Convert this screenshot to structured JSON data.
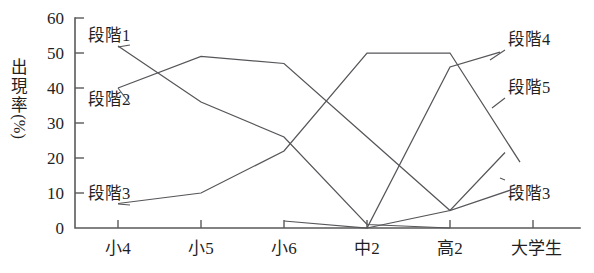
{
  "chart_data": {
    "type": "line",
    "title": "",
    "xlabel": "",
    "ylabel": "出現率(%)",
    "ylabel_chars": [
      "出",
      "現",
      "率"
    ],
    "ylabel_unit": "(%)",
    "categories": [
      "小4",
      "小5",
      "小6",
      "中2",
      "高2",
      "大学生"
    ],
    "ylim": [
      0,
      60
    ],
    "yticks": [
      0,
      10,
      20,
      30,
      40,
      50,
      60
    ],
    "grid": false,
    "legend_position": "inline-annotations",
    "series": [
      {
        "name": "段階1",
        "values": [
          52,
          36,
          26,
          1,
          0,
          0
        ]
      },
      {
        "name": "段階2",
        "values": [
          40,
          49,
          47,
          26,
          5,
          13
        ]
      },
      {
        "name": "段階3",
        "values": [
          7,
          10,
          22,
          50,
          50,
          13
        ]
      },
      {
        "name": "段階4",
        "values": [
          0,
          0,
          2,
          0,
          46,
          53
        ]
      },
      {
        "name": "段階5",
        "values": [
          0,
          0,
          0,
          0,
          5,
          30
        ]
      }
    ],
    "annotations": [
      {
        "label": "段階1",
        "side": "left"
      },
      {
        "label": "段階2",
        "side": "left"
      },
      {
        "label": "段階3",
        "side": "left"
      },
      {
        "label": "段階4",
        "side": "right"
      },
      {
        "label": "段階5",
        "side": "right"
      },
      {
        "label": "段階3",
        "side": "right"
      }
    ]
  },
  "axis": {
    "y_tick_labels": [
      "60",
      "50",
      "40",
      "30",
      "20",
      "10",
      "0"
    ],
    "x_tick_labels": [
      "小4",
      "小5",
      "小6",
      "中2",
      "高2",
      "大学生"
    ]
  },
  "labels": {
    "left_stage1": "段階1",
    "left_stage2": "段階2",
    "left_stage3": "段階3",
    "right_stage4": "段階4",
    "right_stage5": "段階5",
    "right_stage3": "段階3"
  },
  "axis_title": {
    "c1": "出",
    "c2": "現",
    "c3": "率",
    "c4": "(%)"
  },
  "colors": {
    "line": "#56565a",
    "axis": "#5a5a5a",
    "text": "#1f1f1f",
    "background": "#ffffff"
  }
}
